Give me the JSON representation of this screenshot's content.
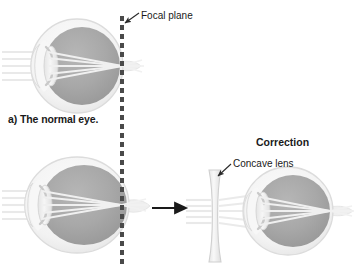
{
  "figure": {
    "background_color": "#ffffff"
  },
  "labels": {
    "focal_plane": "Focal plane",
    "caption_a": "a) The normal eye.",
    "correction": "Correction",
    "concave_lens": "Concave lens"
  },
  "colors": {
    "vitreous": "#a9a9a9",
    "vitreous_dark": "#9a9a9a",
    "sclera": "#f2f2f2",
    "sclera_edge": "#d8d8d8",
    "lens_fill": "#ededed",
    "ray": "#e8e8e8",
    "focal_plane_dash": "#4a4a4a",
    "arrow": "#1a1a1a",
    "leader": "#2a2a2a",
    "text": "#1a1a1a"
  },
  "diagram": {
    "eyes": [
      {
        "id": "normal-eye",
        "role": "normal",
        "center_x": 77,
        "center_y": 66,
        "radius_x": 46,
        "radius_y": 47,
        "focus_x": 123,
        "description": "Normal eye, rays converge exactly at the focal plane on the retina"
      },
      {
        "id": "myopic-eye",
        "role": "myopic",
        "center_x": 77,
        "center_y": 205,
        "radius_x": 52,
        "radius_y": 48,
        "focus_x": 122,
        "description": "Elongated myopic eye, rays converge in front of the retina at the focal plane"
      },
      {
        "id": "corrected-eye",
        "role": "corrected",
        "center_x": 288,
        "center_y": 211,
        "radius_x": 45,
        "radius_y": 44,
        "focus_x": 331,
        "description": "Myopic eye corrected by a concave lens, rays converge on the retina"
      }
    ],
    "focal_plane_line": {
      "x": 122,
      "y_start": 16,
      "y_end": 266,
      "style": "dashed",
      "dash_length": 5,
      "dash_gap": 4,
      "width": 4
    },
    "concave_lens": {
      "x": 215,
      "y_top": 170,
      "y_bottom": 262,
      "shape": "biconcave",
      "edge_width": 8,
      "waist_width": 3
    },
    "transform_arrow": {
      "x_start": 152,
      "x_end": 188,
      "y": 208,
      "direction": "right"
    },
    "ray_count": 5,
    "leaders": [
      {
        "id": "focal-plane-leader",
        "from_x": 139,
        "from_y": 14,
        "to_x": 124,
        "to_y": 24,
        "arrowhead": true
      },
      {
        "id": "concave-lens-leader",
        "from_x": 231,
        "from_y": 165,
        "to_x": 217,
        "to_y": 177,
        "arrowhead": true
      }
    ]
  }
}
